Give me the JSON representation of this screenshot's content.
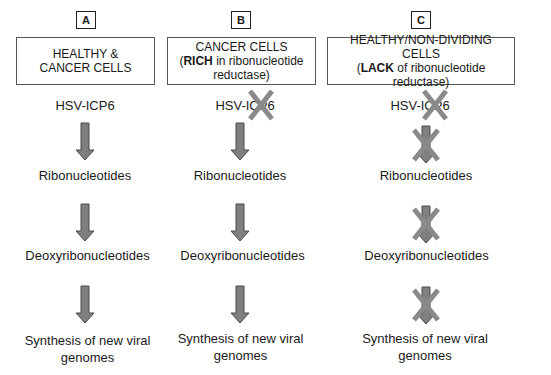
{
  "colors": {
    "arrow_fill": "#7f7f7f",
    "arrow_stroke": "#4a4a4a",
    "cross": "#8a8a8a",
    "box_border": "#555555"
  },
  "columns": [
    {
      "letter": "A",
      "header_line1": "HEALTHY &",
      "header_line2": "CANCER CELLS",
      "header_line3": "",
      "steps": [
        "HSV-ICP6",
        "Ribonucleotides",
        "Deoxyribonucleotides",
        "Synthesis of new viral",
        "genomes"
      ],
      "blocked": {
        "icp6": false,
        "arrow1": false,
        "arrow2": false,
        "arrow3": false
      }
    },
    {
      "letter": "B",
      "header_line1": "CANCER CELLS",
      "header_line2_bold": "RICH",
      "header_line2_pre": "(",
      "header_line2_post": " in ribonucleotide",
      "header_line3": "reductase)",
      "steps": [
        "HSV-ICP6",
        "Ribonucleotides",
        "Deoxyribonucleotides",
        "Synthesis of new viral",
        "genomes"
      ],
      "blocked": {
        "icp6": true,
        "arrow1": false,
        "arrow2": false,
        "arrow3": false
      }
    },
    {
      "letter": "C",
      "header_line1": "HEALTHY/NON-DIVIDING CELLS",
      "header_line2_bold": "LACK",
      "header_line2_pre": "(",
      "header_line2_post": " of ribonucleotide",
      "header_line3": "reductase)",
      "steps": [
        "HSV-ICP6",
        "Ribonucleotides",
        "Deoxyribonucleotides",
        "Synthesis of new viral",
        "genomes"
      ],
      "blocked": {
        "icp6": true,
        "arrow1": true,
        "arrow2": true,
        "arrow3": true
      }
    }
  ]
}
